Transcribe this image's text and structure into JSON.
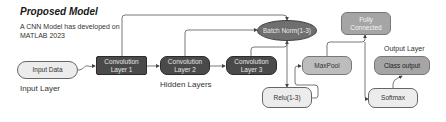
{
  "header": {
    "title": "Proposed Model",
    "subtitle_line1": "A CNN Model has developed on",
    "subtitle_line2": "MATLAB 2023"
  },
  "section_labels": {
    "input_layer": "Input Layer",
    "hidden_layers": "Hidden Layers",
    "output_layer": "Output Layer"
  },
  "nodes": {
    "input_data": "Input Data",
    "conv1_line1": "Convolution",
    "conv1_line2": "Layer 1",
    "conv2_line1": "Convolution",
    "conv2_line2": "Layer 2",
    "conv3_line1": "Convolution",
    "conv3_line2": "Layer 3",
    "batch_norm": "Batch Norm(1-3)",
    "relu": "Relu(1-3)",
    "maxpool": "MaxPool",
    "fully_connected_line1": "Fully",
    "fully_connected_line2": "Connected",
    "softmax": "Softmax",
    "class_output": "Class output"
  },
  "edges": [
    {
      "from": "Input Data",
      "to": "Convolution Layer 1"
    },
    {
      "from": "Convolution Layer 1",
      "to": "Convolution Layer 2"
    },
    {
      "from": "Convolution Layer 2",
      "to": "Convolution Layer 3"
    },
    {
      "from": "Convolution Layer 1",
      "to": "Batch Norm(1-3)"
    },
    {
      "from": "Convolution Layer 2",
      "to": "Batch Norm(1-3)"
    },
    {
      "from": "Convolution Layer 3",
      "to": "Batch Norm(1-3)"
    },
    {
      "from": "Batch Norm(1-3)",
      "to": "Relu(1-3)"
    },
    {
      "from": "Relu(1-3)",
      "to": "MaxPool"
    },
    {
      "from": "MaxPool",
      "to": "Fully Connected"
    },
    {
      "from": "Fully Connected",
      "to": "Softmax"
    },
    {
      "from": "Softmax",
      "to": "Class output"
    }
  ],
  "colors": {
    "dark_node": "#4a4a4a",
    "ellipse_node": "#6f6f6f",
    "gray_node": "#a5a5a5",
    "light_node": "#ececec",
    "connector": "#555555"
  }
}
